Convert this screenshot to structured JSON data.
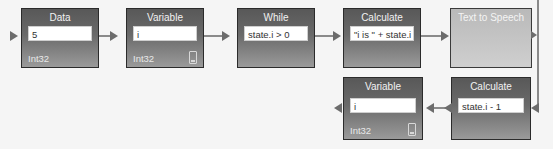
{
  "diagram": {
    "nodes": [
      {
        "id": "data",
        "title": "Data",
        "value": "5",
        "type": "Int32"
      },
      {
        "id": "variable-top",
        "title": "Variable",
        "value": "i",
        "type": "Int32"
      },
      {
        "id": "while",
        "title": "While",
        "value": "state.i > 0"
      },
      {
        "id": "calculate-top",
        "title": "Calculate",
        "value": "\"i is \" + state.i"
      },
      {
        "id": "text-to-speech",
        "title": "Text to Speech"
      },
      {
        "id": "calculate-bottom",
        "title": "Calculate",
        "value": "state.i - 1"
      },
      {
        "id": "variable-bottom",
        "title": "Variable",
        "value": "i",
        "type": "Int32"
      }
    ],
    "edges": [
      {
        "from": "input",
        "to": "data"
      },
      {
        "from": "data",
        "to": "variable-top"
      },
      {
        "from": "variable-top",
        "to": "while"
      },
      {
        "from": "while",
        "to": "calculate-top"
      },
      {
        "from": "calculate-top",
        "to": "text-to-speech"
      },
      {
        "from": "text-to-speech",
        "to": "calculate-bottom"
      },
      {
        "from": "calculate-bottom",
        "to": "variable-bottom"
      },
      {
        "from": "variable-bottom",
        "to": "output"
      }
    ],
    "colors": {
      "node_dark": "#5e5e5e",
      "node_light": "#c2c2c2",
      "connector": "#6c6c6c",
      "background": "#f5f5f5"
    }
  }
}
